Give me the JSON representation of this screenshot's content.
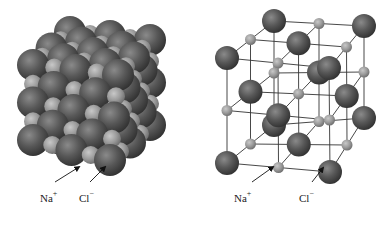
{
  "figure": {
    "panels": [
      {
        "id": "space-filling",
        "title": "",
        "labels": [
          {
            "ion": "Na",
            "charge": "+",
            "x": 40,
            "y": 190
          },
          {
            "ion": "Cl",
            "charge": "−",
            "x": 79,
            "y": 190
          }
        ],
        "arrows": [
          {
            "from": [
              55,
              182
            ],
            "to": [
              79,
              167
            ]
          },
          {
            "from": [
              90,
              182
            ],
            "to": [
              105,
              167
            ]
          }
        ]
      },
      {
        "id": "ball-and-stick",
        "title": "",
        "labels": [
          {
            "ion": "Na",
            "charge": "+",
            "x": 234,
            "y": 190
          },
          {
            "ion": "Cl",
            "charge": "−",
            "x": 299,
            "y": 190
          }
        ],
        "arrows": [
          {
            "from": [
              252,
              182
            ],
            "to": [
              273,
              167
            ]
          },
          {
            "from": [
              312,
              182
            ],
            "to": [
              323,
              168
            ]
          }
        ]
      }
    ],
    "ions": {
      "Na": {
        "label": "Na+",
        "color": "#a0a0a0",
        "role": "small sphere"
      },
      "Cl": {
        "label": "Cl−",
        "color": "#555555",
        "role": "large sphere"
      }
    },
    "lattice": {
      "corners": {
        "FTL": [
          227,
          58
        ],
        "FTR": [
          329,
          68
        ],
        "BTL": [
          274,
          21
        ],
        "BTR": [
          364,
          26
        ],
        "FBL": [
          227,
          163
        ],
        "FBR": [
          330,
          172
        ],
        "BBL": [
          274,
          125
        ],
        "BBR": [
          364,
          118
        ]
      },
      "cl_radius": 12,
      "na_radius": 5.5
    },
    "packing": {
      "corners": {
        "FTL": [
          33,
          65
        ],
        "FTR": [
          118,
          75
        ],
        "BTL": [
          70,
          32
        ],
        "BTR": [
          150,
          40
        ],
        "FBL": [
          33,
          140
        ],
        "FBR": [
          110,
          160
        ],
        "BBL": [
          70,
          120
        ],
        "BBR": [
          150,
          125
        ]
      },
      "cl_radius": 16,
      "na_radius": 9
    }
  }
}
